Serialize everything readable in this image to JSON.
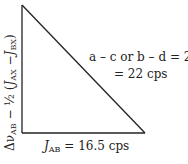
{
  "diagram": {
    "type": "right-triangle",
    "vertices": {
      "top": [
        22,
        5
      ],
      "corner": [
        22,
        133
      ],
      "right": [
        145,
        133
      ]
    },
    "line_color": "#222222",
    "vertical_leg_label": {
      "delta": "Δν",
      "delta_sub": "AB",
      "minus_half": " − ½ (",
      "j1": "J",
      "j1_sub": "AX",
      "dash": " −",
      "j2": "J",
      "j2_sub": "BX",
      "close": ")"
    },
    "hypotenuse_label": {
      "line1_prefix": "a – c or b – d = 2",
      "line1_var": "D",
      "line1_sub": "+",
      "line2": "= 22 cps"
    },
    "horizontal_leg_label": {
      "j": "J",
      "j_sub": "AB",
      "value": " = 16.5 cps"
    }
  }
}
